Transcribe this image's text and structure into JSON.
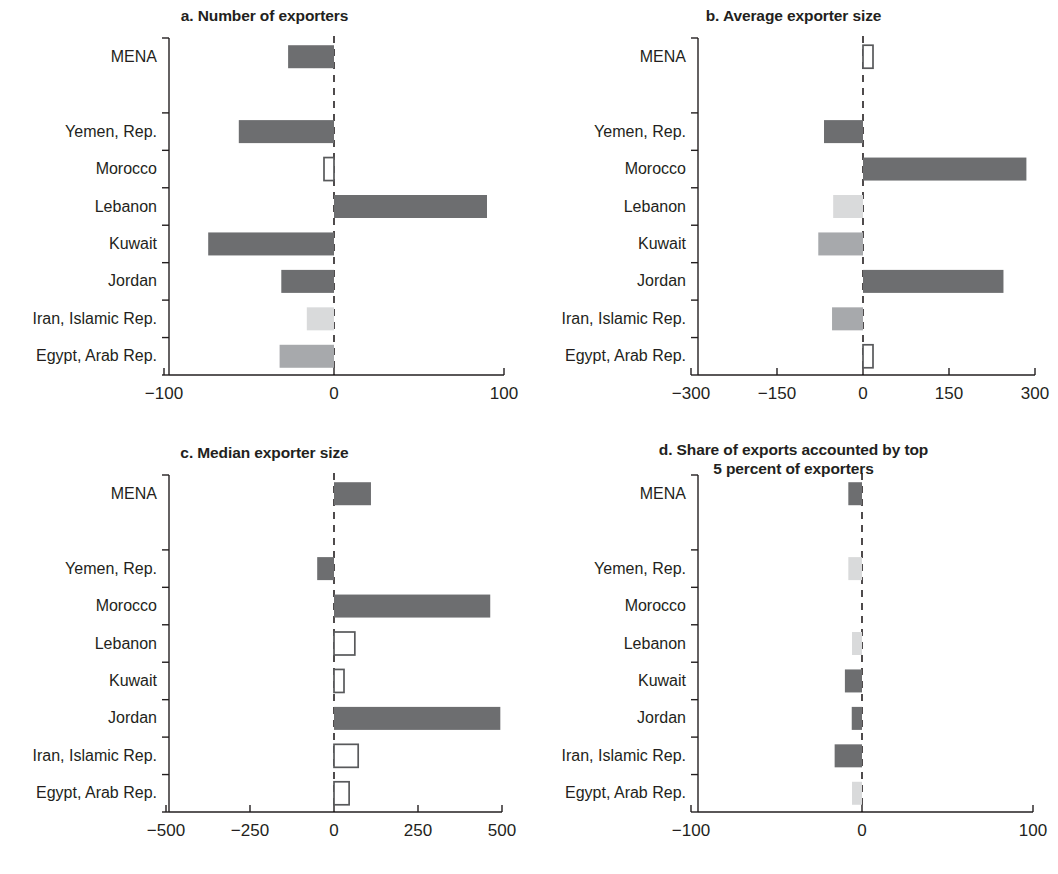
{
  "figure": {
    "categories": [
      "MENA",
      "Yemen, Rep.",
      "Morocco",
      "Lebanon",
      "Kuwait",
      "Jordan",
      "Iran, Islamic Rep.",
      "Egypt, Arab Rep."
    ],
    "colors": {
      "dark": "#6d6e70",
      "medium": "#a7a9ac",
      "light": "#d9dadb",
      "outline": "#58595b",
      "axis": "#231f20",
      "background": "#ffffff"
    }
  },
  "chart_data": [
    {
      "type": "bar",
      "panel": "a",
      "title": "a. Number of exporters",
      "orientation": "horizontal",
      "xlabel": "",
      "ylabel": "",
      "categories": [
        "MENA",
        "Yemen, Rep.",
        "Morocco",
        "Lebanon",
        "Kuwait",
        "Jordan",
        "Iran, Islamic Rep.",
        "Egypt, Arab Rep."
      ],
      "values": [
        -27,
        -56,
        -2,
        90,
        -74,
        -31,
        -16,
        -32
      ],
      "styles": [
        "dark",
        "dark",
        "outline",
        "dark",
        "dark",
        "dark",
        "light",
        "medium"
      ],
      "xlim": [
        -100,
        100
      ],
      "xticks": [
        -100,
        0,
        100
      ],
      "xticklabels": [
        "−100",
        "0",
        "100"
      ],
      "grid": false,
      "zero_line": "dashed"
    },
    {
      "type": "bar",
      "panel": "b",
      "title": "b. Average exporter size",
      "orientation": "horizontal",
      "xlabel": "",
      "ylabel": "",
      "categories": [
        "MENA",
        "Yemen, Rep.",
        "Morocco",
        "Lebanon",
        "Kuwait",
        "Jordan",
        "Iran, Islamic Rep.",
        "Egypt, Arab Rep."
      ],
      "values": [
        14,
        -68,
        285,
        -52,
        -78,
        245,
        -54,
        10
      ],
      "styles": [
        "outline",
        "dark",
        "dark",
        "light",
        "medium",
        "dark",
        "medium",
        "outline"
      ],
      "xlim": [
        -300,
        300
      ],
      "xticks": [
        -300,
        -150,
        0,
        150,
        300
      ],
      "xticklabels": [
        "−300",
        "−150",
        "0",
        "150",
        "300"
      ],
      "grid": false,
      "zero_line": "dashed"
    },
    {
      "type": "bar",
      "panel": "c",
      "title": "c. Median exporter size",
      "orientation": "horizontal",
      "xlabel": "",
      "ylabel": "",
      "categories": [
        "MENA",
        "Yemen, Rep.",
        "Morocco",
        "Lebanon",
        "Kuwait",
        "Jordan",
        "Iran, Islamic Rep.",
        "Egypt, Arab Rep."
      ],
      "values": [
        110,
        -50,
        465,
        62,
        12,
        495,
        72,
        45
      ],
      "styles": [
        "dark",
        "dark",
        "dark",
        "outline",
        "outline",
        "dark",
        "outline",
        "outline"
      ],
      "xlim": [
        -500,
        500
      ],
      "xticks": [
        -500,
        -250,
        0,
        250,
        500
      ],
      "xticklabels": [
        "−500",
        "−250",
        "0",
        "250",
        "500"
      ],
      "grid": false,
      "zero_line": "dashed"
    },
    {
      "type": "bar",
      "panel": "d",
      "title": "d. Share of exports accounted by top 5 percent of exporters",
      "title_line1": "d. Share of exports accounted by top",
      "title_line2": "5 percent of exporters",
      "orientation": "horizontal",
      "xlabel": "",
      "ylabel": "",
      "categories": [
        "MENA",
        "Yemen, Rep.",
        "Morocco",
        "Lebanon",
        "Kuwait",
        "Jordan",
        "Iran, Islamic Rep.",
        "Egypt, Arab Rep."
      ],
      "values": [
        -8,
        -8,
        0,
        -4,
        -10,
        -6,
        -16,
        -4
      ],
      "styles": [
        "dark",
        "light",
        "none",
        "light",
        "dark",
        "dark",
        "dark",
        "light"
      ],
      "xlim": [
        -100,
        100
      ],
      "xticks": [
        -100,
        0,
        100
      ],
      "xticklabels": [
        "−100",
        "0",
        "100"
      ],
      "grid": false,
      "zero_line": "dashed"
    }
  ]
}
